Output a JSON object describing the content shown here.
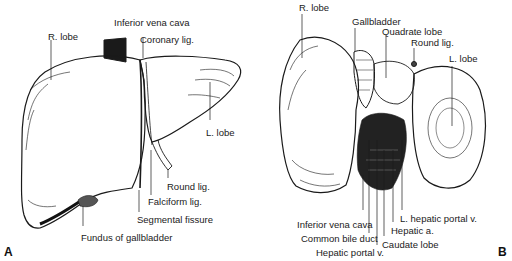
{
  "figure": {
    "panels": [
      {
        "letter": "A",
        "view": "anterior",
        "labels": {
          "r_lobe": "R. lobe",
          "inferior_vena_cava": "Inferior vena cava",
          "coronary_lig": "Coronary lig.",
          "l_lobe": "L. lobe",
          "round_lig": "Round lig.",
          "falciform_lig": "Falciform lig.",
          "segmental_fissure": "Segmental fissure",
          "fundus_of_gallbladder": "Fundus of gallbladder"
        }
      },
      {
        "letter": "B",
        "view": "visceral",
        "labels": {
          "r_lobe": "R. lobe",
          "gallbladder": "Gallbladder",
          "quadrate_lobe": "Quadrate lobe",
          "round_lig": "Round lig.",
          "l_lobe": "L. lobe",
          "l_hepatic_portal_v": "L. hepatic portal v.",
          "inferior_vena_cava": "Inferior vena cava",
          "hepatic_a": "Hepatic a.",
          "common_bile_duct": "Common bile duct",
          "caudate_lobe": "Caudate lobe",
          "hepatic_portal_v": "Hepatic portal v."
        }
      }
    ]
  },
  "colors": {
    "ink": "#1a1a1a",
    "background": "#ffffff"
  }
}
